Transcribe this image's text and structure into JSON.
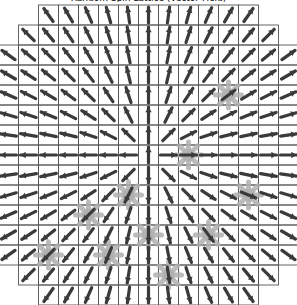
{
  "figure": {
    "title": "Random Spin Lattice (Vector Field)",
    "background_color": "#ffffff"
  },
  "chart_data": {
    "type": "scatter",
    "title": "Random Spin Lattice (Vector Field)",
    "subtitle": "",
    "xlabel": "",
    "ylabel": "",
    "xlim": [
      -8.5,
      8.5
    ],
    "ylim": [
      -8.5,
      8.5
    ],
    "grid": true,
    "legend": false,
    "xticks": [],
    "yticks": [],
    "grid_color": "#555555",
    "arrow_color": "#3a3a3a",
    "marker_color": "#b0b0b0",
    "grid_spacing_px": 20,
    "cell_count_across": 15,
    "octagon_radius_cells": 7.5,
    "octagon_corner_cut_cells": 3,
    "series": [
      {
        "name": "spin vectors",
        "marker": "arrow",
        "color": "#3a3a3a",
        "note": "one vector per lattice site inside octagon; direction = radial outward, length ~0.9 cell"
      },
      {
        "name": "highlighted sites",
        "marker": "star",
        "color": "#b0b0b0",
        "size_px": 26,
        "points": [
          {
            "x": 4,
            "y": 3
          },
          {
            "x": 2,
            "y": 0
          },
          {
            "x": -1,
            "y": -2
          },
          {
            "x": -3,
            "y": -3
          },
          {
            "x": 0,
            "y": -4
          },
          {
            "x": -2,
            "y": -5
          },
          {
            "x": 3,
            "y": -4
          },
          {
            "x": 5,
            "y": -2
          },
          {
            "x": 1,
            "y": -6
          },
          {
            "x": -5,
            "y": -5
          }
        ]
      }
    ]
  }
}
